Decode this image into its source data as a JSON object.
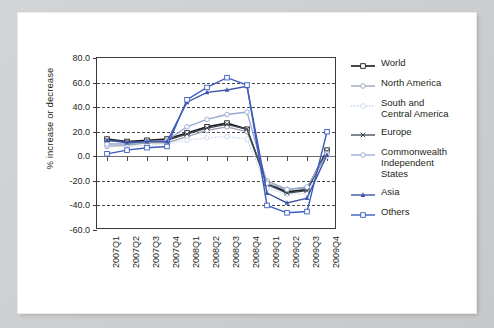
{
  "figure": {
    "ylabel": "% increase or decrease"
  },
  "legend": {
    "items": [
      {
        "label": "World",
        "color": "#1b1b1b",
        "marker": "square-open",
        "dash": "solid",
        "width": 1.6
      },
      {
        "label": "North America",
        "color": "#9aa2ad",
        "marker": "circle-open",
        "dash": "solid",
        "width": 1.3
      },
      {
        "label": "South and\nCentral America",
        "color": "#c9d6ea",
        "marker": "circle-open",
        "dash": "dotted",
        "width": 1.3
      },
      {
        "label": "Europe",
        "color": "#3c4352",
        "marker": "x",
        "dash": "solid",
        "width": 1.3
      },
      {
        "label": "Commonwealth\nIndependent\nStates",
        "color": "#96a8d4",
        "marker": "circle-open",
        "dash": "solid",
        "width": 1.3
      },
      {
        "label": "Asia",
        "color": "#3f55a8",
        "marker": "triangle",
        "dash": "solid",
        "width": 1.4
      },
      {
        "label": "Others",
        "color": "#3a5cc2",
        "marker": "square-open",
        "dash": "solid",
        "width": 1.4
      }
    ]
  },
  "chart_data": {
    "type": "line",
    "title": "",
    "xlabel": "",
    "ylabel": "% increase or decrease",
    "ylim": [
      -60,
      80
    ],
    "yticks": [
      "80.0",
      "60.0",
      "40.0",
      "20.0",
      "0.0",
      "-20.0",
      "-40.0",
      "-60.0"
    ],
    "ytick_values": [
      80,
      60,
      40,
      20,
      0,
      -20,
      -40,
      -60
    ],
    "grid": "horizontal-dashed",
    "legend_position": "right",
    "categories": [
      "2007Q1",
      "2007Q2",
      "2007Q3",
      "2007Q4",
      "2008Q1",
      "2008Q2",
      "2008Q3",
      "2008Q4",
      "2009Q1",
      "2009Q2",
      "2009Q3",
      "2009Q4"
    ],
    "series": [
      {
        "name": "World",
        "color": "#1b1b1b",
        "marker": "square-open",
        "dash": "solid",
        "width": 1.6,
        "values": [
          14,
          12,
          13,
          14,
          19,
          24,
          27,
          22,
          -22,
          -29,
          -27,
          5
        ]
      },
      {
        "name": "North America",
        "color": "#9aa2ad",
        "marker": "circle-open",
        "dash": "solid",
        "width": 1.3,
        "values": [
          8,
          9,
          11,
          11,
          16,
          21,
          24,
          20,
          -20,
          -27,
          -26,
          3
        ]
      },
      {
        "name": "South and Central America",
        "color": "#c9d6ea",
        "marker": "circle-open",
        "dash": "dotted",
        "width": 1.3,
        "values": [
          9,
          8,
          9,
          10,
          13,
          15,
          16,
          14,
          -26,
          -31,
          -30,
          0
        ]
      },
      {
        "name": "Europe",
        "color": "#3c4352",
        "marker": "x",
        "dash": "solid",
        "width": 1.3,
        "values": [
          13,
          12,
          12,
          13,
          18,
          23,
          26,
          22,
          -23,
          -30,
          -28,
          4
        ]
      },
      {
        "name": "Commonwealth Independent States",
        "color": "#96a8d4",
        "marker": "circle-open",
        "dash": "solid",
        "width": 1.3,
        "values": [
          10,
          10,
          12,
          13,
          24,
          30,
          34,
          36,
          -22,
          -27,
          -25,
          2
        ]
      },
      {
        "name": "Asia",
        "color": "#3f55a8",
        "marker": "triangle",
        "dash": "solid",
        "width": 1.4,
        "values": [
          13,
          11,
          12,
          12,
          44,
          52,
          54,
          57,
          -30,
          -38,
          -34,
          1
        ]
      },
      {
        "name": "Others",
        "color": "#3a5cc2",
        "marker": "square-open",
        "dash": "solid",
        "width": 1.4,
        "values": [
          2,
          5,
          7,
          8,
          46,
          56,
          64,
          58,
          -40,
          -46,
          -45,
          20
        ]
      }
    ]
  }
}
